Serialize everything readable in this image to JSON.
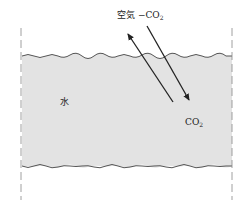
{
  "diagram": {
    "labels": {
      "air": "空気",
      "dash": "−",
      "co2_top": "CO",
      "co2_top_sub": "2",
      "water": "水",
      "co2_bottom": "CO",
      "co2_bottom_sub": "2"
    },
    "colors": {
      "water_fill": "#e3e3e3",
      "line": "#222222",
      "wave": "#555555",
      "boundary": "#888888"
    }
  }
}
